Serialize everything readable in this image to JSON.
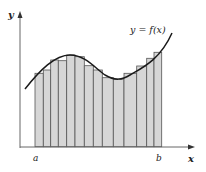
{
  "diagram": {
    "type": "riemann-sum",
    "curve_label": "y = f(x)",
    "x_axis_label": "x",
    "y_axis_label": "y",
    "interval_start_label": "a",
    "interval_end_label": "b",
    "bar_fill": "#d6d6d6",
    "bar_stroke": "#555555",
    "curve_color": "#1a1a1a"
  }
}
